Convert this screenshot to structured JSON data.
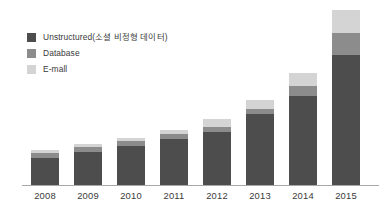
{
  "chart_data": {
    "type": "bar",
    "subtype": "stacked-bar",
    "title": "",
    "xlabel": "",
    "ylabel": "",
    "grid": false,
    "legend_position": "top-left",
    "categories": [
      "2008",
      "2009",
      "2010",
      "2011",
      "2012",
      "2013",
      "2014",
      "2015"
    ],
    "series": [
      {
        "name": "Unstructured(소셜 비정형 데이터)",
        "color": "#4d4d4d",
        "values": [
          26,
          32,
          38,
          45,
          52,
          69,
          87,
          127
        ]
      },
      {
        "name": "Database",
        "color": "#8c8c8c",
        "values": [
          5,
          5,
          5,
          5,
          5,
          5,
          10,
          22
        ]
      },
      {
        "name": "E-mall",
        "color": "#d4d4d4",
        "values": [
          3,
          3,
          3,
          4,
          8,
          9,
          13,
          22
        ]
      }
    ],
    "totals": [
      34,
      40,
      46,
      54,
      65,
      83,
      110,
      171
    ],
    "ylim": [
      0,
      180
    ],
    "axis_color": "#a8a8a8",
    "background": "#ffffff"
  },
  "legend": {
    "items": [
      {
        "label": "Unstructured(소셜 비정형 데이터)",
        "color": "#4d4d4d"
      },
      {
        "label": "Database",
        "color": "#8c8c8c"
      },
      {
        "label": "E-mall",
        "color": "#d4d4d4"
      }
    ]
  },
  "xaxis": {
    "ticks": [
      "2008",
      "2009",
      "2010",
      "2011",
      "2012",
      "2013",
      "2014",
      "2015"
    ]
  }
}
